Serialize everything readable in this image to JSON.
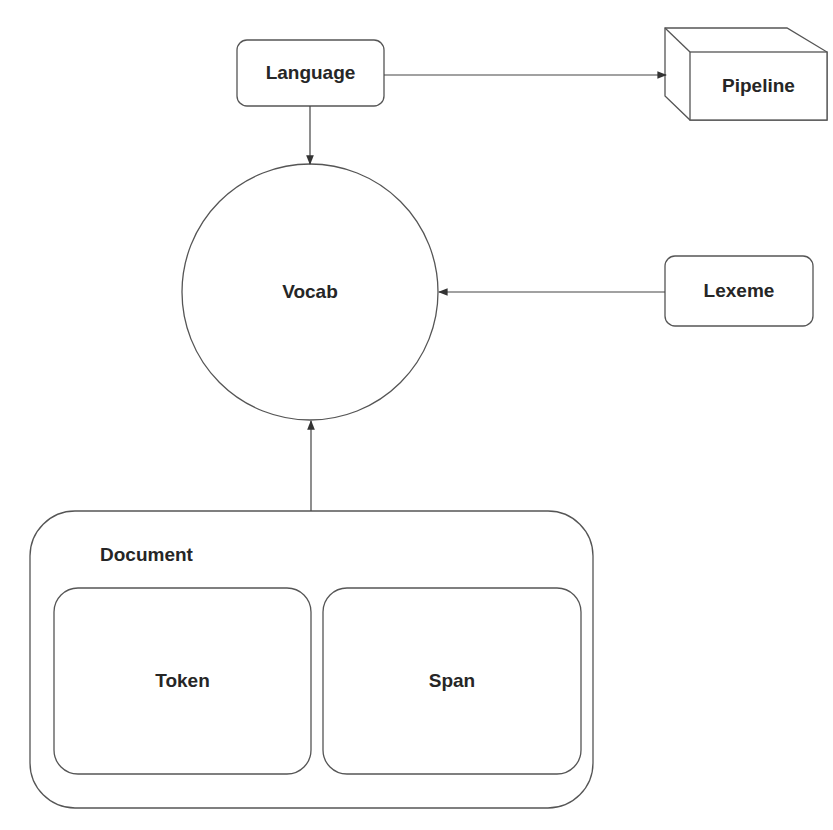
{
  "diagram": {
    "colors": {
      "stroke": "#555555",
      "text": "#262626",
      "background": "#ffffff"
    },
    "nodes": {
      "language": {
        "label": "Language",
        "shape": "rounded-rectangle"
      },
      "pipeline": {
        "label": "Pipeline",
        "shape": "cube"
      },
      "vocab": {
        "label": "Vocab",
        "shape": "circle"
      },
      "lexeme": {
        "label": "Lexeme",
        "shape": "rounded-rectangle"
      },
      "document": {
        "label": "Document",
        "shape": "rounded-container",
        "children": [
          {
            "label": "Token",
            "shape": "rounded-rectangle"
          },
          {
            "label": "Span",
            "shape": "rounded-rectangle"
          }
        ]
      }
    },
    "edges": [
      {
        "from": "Language",
        "to": "Pipeline"
      },
      {
        "from": "Language",
        "to": "Vocab"
      },
      {
        "from": "Lexeme",
        "to": "Vocab"
      },
      {
        "from": "Document",
        "to": "Vocab"
      }
    ]
  }
}
